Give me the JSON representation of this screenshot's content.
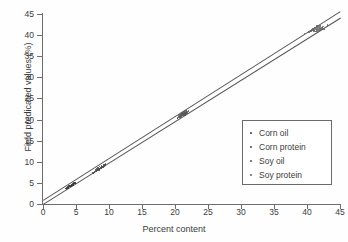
{
  "chart_data": {
    "type": "scatter",
    "title": "",
    "xlabel": "Percent content",
    "ylabel": "Field predicated values (%)",
    "xlim": [
      0,
      45
    ],
    "ylim": [
      0,
      45
    ],
    "xticks": [
      0,
      5,
      10,
      15,
      20,
      25,
      30,
      35,
      40,
      45
    ],
    "yticks": [
      0,
      5,
      10,
      15,
      20,
      25,
      30,
      35,
      40,
      45
    ],
    "grid": false,
    "legend_position": "lower right",
    "series": [
      {
        "name": "Corn oil",
        "color": "#3b3b3b",
        "marker": "dot",
        "points": [
          [
            3.45,
            3.7
          ],
          [
            3.6,
            3.85
          ],
          [
            3.72,
            3.95
          ],
          [
            3.8,
            4.05
          ],
          [
            3.9,
            4.1
          ],
          [
            4.0,
            4.2
          ],
          [
            4.08,
            4.28
          ],
          [
            4.15,
            4.35
          ],
          [
            4.25,
            4.42
          ],
          [
            4.32,
            4.5
          ],
          [
            4.4,
            4.55
          ],
          [
            4.5,
            4.62
          ],
          [
            4.58,
            4.7
          ],
          [
            4.65,
            4.78
          ],
          [
            4.75,
            4.85
          ],
          [
            4.85,
            4.95
          ],
          [
            4.95,
            5.02
          ],
          [
            3.55,
            3.62
          ],
          [
            4.2,
            4.1
          ],
          [
            4.45,
            4.38
          ],
          [
            3.98,
            4.32
          ],
          [
            4.62,
            4.5
          ],
          [
            4.3,
            4.62
          ],
          [
            3.85,
            3.78
          ],
          [
            4.7,
            4.98
          ]
        ]
      },
      {
        "name": "Corn protein",
        "color": "#4a4a4a",
        "marker": "dot",
        "points": [
          [
            7.55,
            7.4
          ],
          [
            7.8,
            7.62
          ],
          [
            8.0,
            7.85
          ],
          [
            8.15,
            8.0
          ],
          [
            8.28,
            8.12
          ],
          [
            8.4,
            8.25
          ],
          [
            8.5,
            8.35
          ],
          [
            8.6,
            8.45
          ],
          [
            8.7,
            8.55
          ],
          [
            8.8,
            8.62
          ],
          [
            8.9,
            8.72
          ],
          [
            9.0,
            8.82
          ],
          [
            9.1,
            8.92
          ],
          [
            9.2,
            9.02
          ],
          [
            9.35,
            9.18
          ],
          [
            9.5,
            9.45
          ],
          [
            8.35,
            8.6
          ],
          [
            8.75,
            8.38
          ],
          [
            8.2,
            8.45
          ],
          [
            9.05,
            8.65
          ],
          [
            8.55,
            8.9
          ],
          [
            7.95,
            8.2
          ],
          [
            9.25,
            9.35
          ],
          [
            8.45,
            8.05
          ],
          [
            8.88,
            9.05
          ]
        ]
      },
      {
        "name": "Soy oil",
        "color": "#555555",
        "marker": "dot",
        "points": [
          [
            20.4,
            20.3
          ],
          [
            20.6,
            20.6
          ],
          [
            20.75,
            20.85
          ],
          [
            20.9,
            21.0
          ],
          [
            21.0,
            21.1
          ],
          [
            21.1,
            21.2
          ],
          [
            21.2,
            21.3
          ],
          [
            21.3,
            21.38
          ],
          [
            21.4,
            21.45
          ],
          [
            21.5,
            21.55
          ],
          [
            21.6,
            21.62
          ],
          [
            21.75,
            21.75
          ],
          [
            21.9,
            21.9
          ],
          [
            22.05,
            22.0
          ],
          [
            20.85,
            21.35
          ],
          [
            21.25,
            20.95
          ],
          [
            21.05,
            21.55
          ],
          [
            21.45,
            21.12
          ],
          [
            20.7,
            21.15
          ],
          [
            21.65,
            21.3
          ],
          [
            21.15,
            21.7
          ],
          [
            20.95,
            20.75
          ],
          [
            21.8,
            21.5
          ],
          [
            21.35,
            21.85
          ],
          [
            20.55,
            20.95
          ],
          [
            21.55,
            21.05
          ],
          [
            21.7,
            22.05
          ],
          [
            20.8,
            20.55
          ]
        ]
      },
      {
        "name": "Soy protein",
        "color": "#626262",
        "marker": "dot",
        "points": [
          [
            40.3,
            40.75
          ],
          [
            40.6,
            40.95
          ],
          [
            40.8,
            41.05
          ],
          [
            41.0,
            41.15
          ],
          [
            41.15,
            41.25
          ],
          [
            41.3,
            41.32
          ],
          [
            41.45,
            41.4
          ],
          [
            41.6,
            41.48
          ],
          [
            41.75,
            41.55
          ],
          [
            41.9,
            41.62
          ],
          [
            42.05,
            41.7
          ],
          [
            42.2,
            41.8
          ],
          [
            42.35,
            41.9
          ],
          [
            42.5,
            42.0
          ],
          [
            41.2,
            41.7
          ],
          [
            41.55,
            41.0
          ],
          [
            41.35,
            41.85
          ],
          [
            41.85,
            41.25
          ],
          [
            40.95,
            41.45
          ],
          [
            42.1,
            41.35
          ],
          [
            41.7,
            41.92
          ],
          [
            41.05,
            40.9
          ],
          [
            42.3,
            41.55
          ],
          [
            41.5,
            42.1
          ],
          [
            40.7,
            41.25
          ],
          [
            42.0,
            41.1
          ],
          [
            41.4,
            40.85
          ],
          [
            41.95,
            42.2
          ],
          [
            42.6,
            41.45
          ],
          [
            40.5,
            41.0
          ],
          [
            43.1,
            42.35
          ],
          [
            39.6,
            40.4
          ]
        ]
      }
    ],
    "fit_lines": [
      {
        "name": "fit-upper",
        "x0": 0.0,
        "y0": 0.9,
        "x1": 45.0,
        "y1": 45.6,
        "color": "#555555"
      },
      {
        "name": "fit-lower",
        "x0": 0.0,
        "y0": 0.0,
        "x1": 45.0,
        "y1": 44.1,
        "color": "#555555"
      }
    ]
  },
  "legend": {
    "entries": [
      {
        "label": "Corn oil",
        "color": "#3b3b3b"
      },
      {
        "label": "Corn protein",
        "color": "#4a4a4a"
      },
      {
        "label": "Soy oil",
        "color": "#555555"
      },
      {
        "label": "Soy protein",
        "color": "#626262"
      }
    ]
  }
}
